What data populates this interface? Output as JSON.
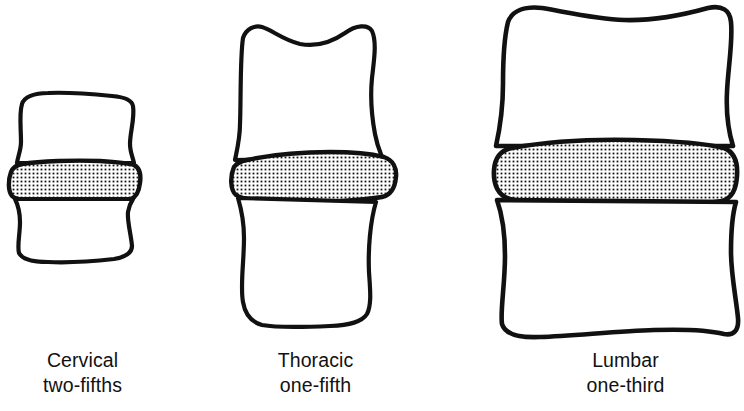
{
  "figure": {
    "title": "",
    "type": "anatomical-diagram",
    "background_color": "#ffffff",
    "ink_color": "#111111",
    "disc_fill": "stipple-dot-pattern"
  },
  "segments": [
    {
      "id": "cervical",
      "label": "Cervical",
      "fraction": "two-fifths",
      "disc_pattern": "stippled",
      "geometry": {
        "left": 10,
        "right": 142,
        "top": 93,
        "bottom": 263,
        "disc_top": 156,
        "disc_bottom": 201,
        "body_width": 132,
        "total_height": 170,
        "disc_height": 45
      }
    },
    {
      "id": "thoracic",
      "label": "Thoracic",
      "fraction": "one-fifth",
      "disc_pattern": "stippled",
      "geometry": {
        "left": 232,
        "right": 402,
        "top": 24,
        "bottom": 327,
        "disc_top": 152,
        "disc_bottom": 202,
        "body_width": 170,
        "total_height": 303,
        "disc_height": 50
      }
    },
    {
      "id": "lumbar",
      "label": "Lumbar",
      "fraction": "one-third",
      "disc_pattern": "stippled",
      "geometry": {
        "left": 492,
        "right": 738,
        "top": 6,
        "bottom": 337,
        "disc_top": 140,
        "disc_bottom": 206,
        "body_width": 246,
        "total_height": 331,
        "disc_height": 66
      }
    }
  ]
}
